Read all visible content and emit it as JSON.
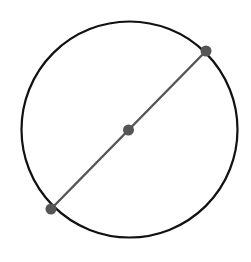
{
  "diagram": {
    "type": "circle-with-diameter",
    "canvas": {
      "width": 251,
      "height": 262,
      "background": "#ffffff"
    },
    "circle": {
      "cx": 129.5,
      "cy": 129.5,
      "r": 108,
      "stroke": "#111111",
      "stroke_width": 2.2
    },
    "diameter": {
      "x1": 51,
      "y1": 209,
      "x2": 206,
      "y2": 51,
      "stroke": "#555555",
      "stroke_width": 2.4
    },
    "points": [
      {
        "name": "endpoint-upper-right",
        "cx": 206,
        "cy": 51,
        "r": 5.5,
        "fill": "#555555"
      },
      {
        "name": "center",
        "cx": 128.5,
        "cy": 130,
        "r": 5.5,
        "fill": "#555555"
      },
      {
        "name": "endpoint-lower-left",
        "cx": 51,
        "cy": 209,
        "r": 5.5,
        "fill": "#555555"
      }
    ]
  }
}
